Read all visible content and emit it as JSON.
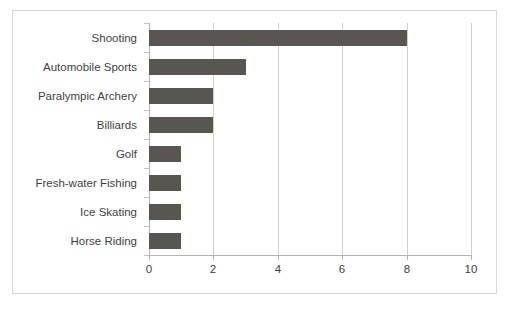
{
  "chart_data": {
    "type": "bar",
    "orientation": "horizontal",
    "title": "",
    "subtitle": "",
    "xlabel": "",
    "ylabel": "",
    "categories": [
      "Shooting",
      "Automobile Sports",
      "Paralympic Archery",
      "Billiards",
      "Golf",
      "Fresh-water Fishing",
      "Ice Skating",
      "Horse Riding"
    ],
    "values": [
      8,
      3,
      2,
      2,
      1,
      1,
      1,
      1
    ],
    "xlim": [
      0,
      10
    ],
    "xticks": [
      0,
      2,
      4,
      6,
      8,
      10
    ],
    "xtick_labels": [
      "0",
      "2",
      "4",
      "6",
      "8",
      "10"
    ],
    "grid": "vertical",
    "legend": "none",
    "bar_color": "#595550",
    "gridline_color": "#d0d0d0",
    "axis_color": "#b4b4b4",
    "border_color": "#d9d9d9",
    "background_color": "#ffffff",
    "text_color": "#3f3f3f"
  }
}
